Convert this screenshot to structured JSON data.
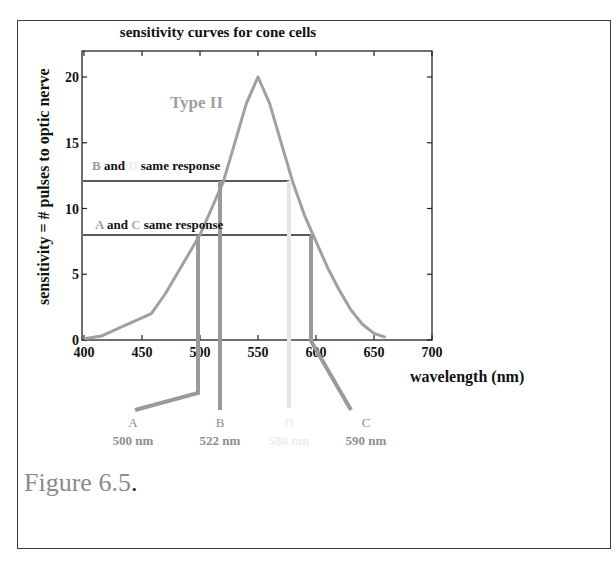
{
  "figure": {
    "title": "sensitivity curves for cone cells",
    "ylabel": "sensitivity = # pulses to optic nerve",
    "xlabel": "wavelength (nm)",
    "caption_main": "Figure 6.5",
    "caption_dot": ".",
    "curve_label": "Type II",
    "annotation_bd": {
      "p1": "B",
      "p2": " and ",
      "p3": "D",
      "p4": " same response"
    },
    "annotation_ac": {
      "p1": "A",
      "p2": " and ",
      "p3": "C",
      "p4": " same response"
    },
    "markers": [
      {
        "letter": "A",
        "value": "500 nm"
      },
      {
        "letter": "B",
        "value": "522 nm"
      },
      {
        "letter": "D",
        "value": "580 nm"
      },
      {
        "letter": "C",
        "value": "590 nm"
      }
    ],
    "x_ticks": [
      "400",
      "450",
      "500",
      "550",
      "600",
      "650",
      "700"
    ],
    "y_ticks": [
      "0",
      "5",
      "10",
      "15",
      "20"
    ]
  },
  "colors": {
    "curve": "#a0a0a0",
    "axis": "#222222",
    "marker_strong": "#9a9a9a",
    "marker_faint": "#e6e6e6",
    "label_gray": "#9c9c9c"
  },
  "chart_data": {
    "type": "line",
    "title": "sensitivity curves for cone cells",
    "xlabel": "wavelength (nm)",
    "ylabel": "sensitivity = # pulses to optic nerve",
    "xlim": [
      400,
      700
    ],
    "ylim": [
      0,
      22
    ],
    "x_ticks": [
      400,
      450,
      500,
      550,
      600,
      650,
      700
    ],
    "y_ticks": [
      0,
      5,
      10,
      15,
      20
    ],
    "grid": false,
    "series": [
      {
        "name": "Type II",
        "x": [
          400,
          415,
          430,
          445,
          458,
          470,
          480,
          490,
          500,
          510,
          520,
          530,
          540,
          550,
          560,
          570,
          580,
          590,
          600,
          610,
          620,
          630,
          640,
          650,
          660
        ],
        "y": [
          0.1,
          0.3,
          0.9,
          1.5,
          2.0,
          3.5,
          5.0,
          6.5,
          8.0,
          10.0,
          12.0,
          15.0,
          18.0,
          20.0,
          18.0,
          15.0,
          12.0,
          9.5,
          7.5,
          5.5,
          3.8,
          2.3,
          1.2,
          0.5,
          0.2
        ]
      }
    ],
    "reference_lines": [
      {
        "label": "B and D same response",
        "y": 12,
        "x_from": 400,
        "x_to": 580
      },
      {
        "label": "A and C same response",
        "y": 8,
        "x_from": 400,
        "x_to": 600
      }
    ],
    "markers": [
      {
        "label": "A",
        "wavelength_nm": 500,
        "response": 8
      },
      {
        "label": "B",
        "wavelength_nm": 522,
        "response": 12
      },
      {
        "label": "D",
        "wavelength_nm": 580,
        "response": 12
      },
      {
        "label": "C",
        "wavelength_nm": 590,
        "response": 8
      }
    ]
  }
}
